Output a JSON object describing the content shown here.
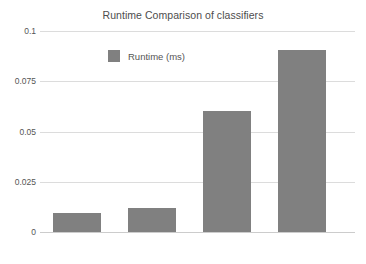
{
  "chart_data": {
    "type": "bar",
    "title": "Runtime Comparison of classifiers",
    "xlabel": "",
    "ylabel": "",
    "categories": [
      "SVM",
      "SVM + HOG",
      "Vanilla NN",
      "CNN"
    ],
    "series": [
      {
        "name": "Runtime (ms)",
        "color": "#808080",
        "values": [
          0.0095,
          0.012,
          0.06,
          0.0905
        ]
      }
    ],
    "ylim": [
      0,
      0.1
    ],
    "yticks": [
      0,
      0.025,
      0.05,
      0.075,
      0.1
    ],
    "ytick_labels": [
      "0",
      "0.025",
      "0.05",
      "0.075",
      "0.1"
    ],
    "grid": true,
    "grid_axis": "y",
    "legend": {
      "position": "top-left-inside",
      "entries": [
        {
          "label": "Runtime (ms)",
          "color": "#808080"
        }
      ]
    },
    "colors": {
      "bar": "#808080",
      "gridline": "#dcdcdc",
      "axis": "#cccccc",
      "text": "#555555",
      "title": "#4d4d4d",
      "background": "#ffffff"
    }
  }
}
